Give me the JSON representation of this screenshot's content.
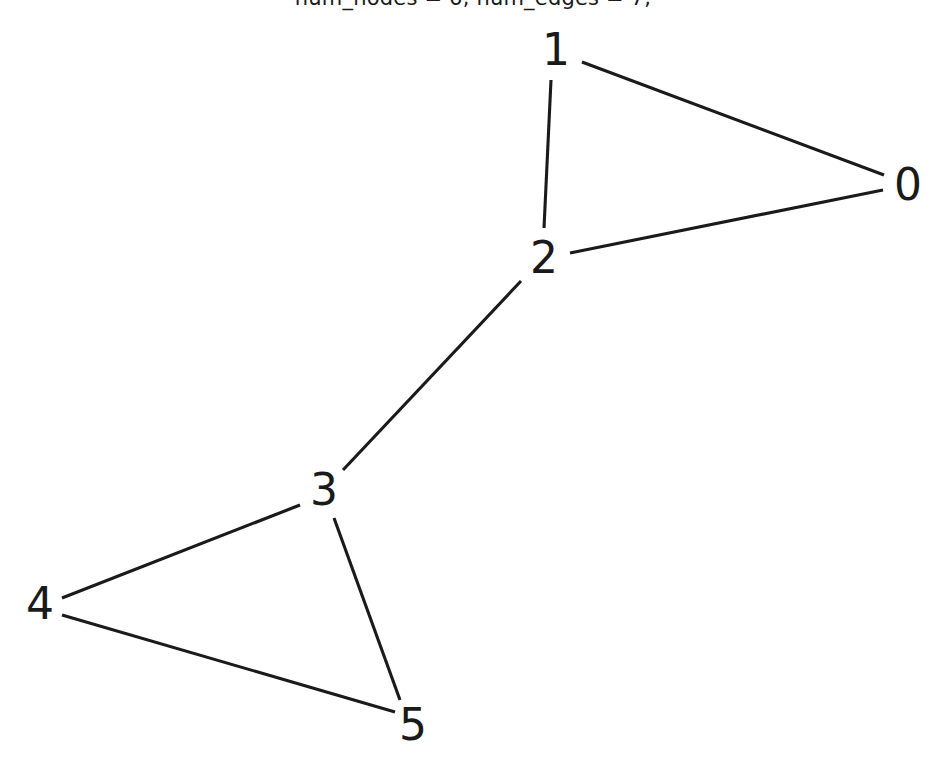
{
  "figure": {
    "width": 946,
    "height": 771,
    "background_color": "#ffffff",
    "title": "num_nodes = 6, num_edges = 7,",
    "title_clipped": true
  },
  "style": {
    "edge_color": "#1a1a1a",
    "edge_width": 3.1,
    "label_color": "#1a1a1a",
    "label_font_size": 44
  },
  "chart_data": {
    "type": "diagram",
    "subtype": "node-link-graph",
    "title": "num_nodes = 6, num_edges = 7,",
    "xlabel": "",
    "ylabel": "",
    "grid": false,
    "legend": null,
    "directed": false,
    "node_count": 6,
    "edge_count": 7,
    "nodes": [
      {
        "id": "0",
        "label": "0",
        "x": 908,
        "y": 185
      },
      {
        "id": "1",
        "label": "1",
        "x": 556,
        "y": 50
      },
      {
        "id": "2",
        "label": "2",
        "x": 544,
        "y": 258
      },
      {
        "id": "3",
        "label": "3",
        "x": 324,
        "y": 490
      },
      {
        "id": "4",
        "label": "4",
        "x": 40,
        "y": 604
      },
      {
        "id": "5",
        "label": "5",
        "x": 413,
        "y": 725
      }
    ],
    "edges": [
      {
        "source": "1",
        "target": "0",
        "x1": 582,
        "y1": 62,
        "x2": 884,
        "y2": 175
      },
      {
        "source": "1",
        "target": "2",
        "x1": 551,
        "y1": 80,
        "x2": 544,
        "y2": 228
      },
      {
        "source": "2",
        "target": "0",
        "x1": 570,
        "y1": 253,
        "x2": 883,
        "y2": 190
      },
      {
        "source": "2",
        "target": "3",
        "x1": 521,
        "y1": 281,
        "x2": 343,
        "y2": 470
      },
      {
        "source": "3",
        "target": "4",
        "x1": 300,
        "y1": 505,
        "x2": 62,
        "y2": 598
      },
      {
        "source": "3",
        "target": "5",
        "x1": 334,
        "y1": 518,
        "x2": 400,
        "y2": 700
      },
      {
        "source": "4",
        "target": "5",
        "x1": 62,
        "y1": 615,
        "x2": 395,
        "y2": 712
      }
    ]
  }
}
